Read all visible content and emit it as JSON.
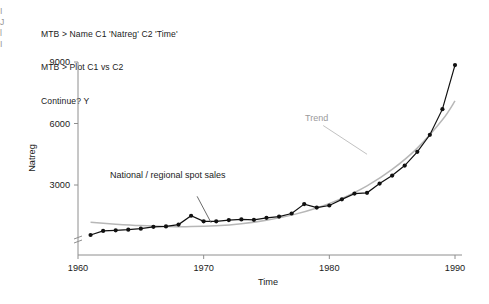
{
  "session": {
    "lines": [
      "MTB > Name C1 'Natreg' C2 'Time'",
      "MTB > Plot C1 vs C2",
      "Continue? Y"
    ],
    "line1": "MTB > Name C1 'Natreg' C2 'Time'",
    "line2": "MTB > Plot C1 vs C2",
    "line3": "Continue? Y"
  },
  "edge_fragments": [
    "I",
    "J",
    "l",
    "I"
  ],
  "colors": {
    "data_series": "#111111",
    "trend_line": "#b7b7b7",
    "axis": "#8e8e8e",
    "text": "#1b1b1b",
    "trend_label": "#9a9a9a",
    "background": "#ffffff"
  },
  "chart_data": {
    "type": "line",
    "title": "",
    "xlabel": "Time",
    "ylabel": "Natreg",
    "xlim": [
      1960,
      1990
    ],
    "ylim": [
      0,
      9600
    ],
    "xticks": [
      1960,
      1970,
      1980,
      1990
    ],
    "xtick_labels": [
      "1960",
      "1970",
      "1980",
      "1990"
    ],
    "yticks": [
      3000,
      6000,
      9000
    ],
    "ytick_labels": [
      "3000",
      "6000",
      "9000"
    ],
    "grid": false,
    "legend": "none",
    "y_axis_break": true,
    "annotations": [
      {
        "text": "National / regional spot sales",
        "x": 1969.0,
        "y": 2350,
        "leader_to_x": 1970.6,
        "leader_to_y": 1150
      },
      {
        "text": "Trend",
        "x": 1977.6,
        "y": 5950,
        "leader_to_x": 1983.0,
        "leader_to_y": 4500
      }
    ],
    "series": [
      {
        "name": "Natreg",
        "marker": "filled-circle",
        "x": [
          1961.0,
          1962.0,
          1963.0,
          1964.0,
          1965.0,
          1966.0,
          1967.0,
          1968.0,
          1969.0,
          1970.0,
          1971.0,
          1972.0,
          1973.0,
          1974.0,
          1975.0,
          1976.0,
          1977.0,
          1978.0,
          1979.0,
          1980.0,
          1981.0,
          1982.0,
          1983.0,
          1984.0,
          1985.0,
          1986.0,
          1987.0,
          1988.0,
          1989.0,
          1990.0
        ],
        "values": [
          560,
          760,
          790,
          820,
          870,
          960,
          980,
          1070,
          1500,
          1230,
          1230,
          1290,
          1320,
          1300,
          1400,
          1460,
          1610,
          2070,
          1900,
          2000,
          2300,
          2580,
          2620,
          3070,
          3460,
          3950,
          4620,
          5450,
          6700,
          8850
        ]
      },
      {
        "name": "Trend",
        "marker": "none",
        "smooth": true,
        "x": [
          1961.0,
          1963.0,
          1965.0,
          1967.0,
          1969.0,
          1971.0,
          1973.0,
          1975.0,
          1977.0,
          1979.0,
          1981.0,
          1983.0,
          1985.0,
          1987.0,
          1989.0,
          1990.0
        ],
        "values": [
          1180,
          1090,
          1020,
          980,
          970,
          1010,
          1110,
          1280,
          1530,
          1880,
          2350,
          2960,
          3760,
          4800,
          6180,
          7100
        ]
      }
    ]
  }
}
